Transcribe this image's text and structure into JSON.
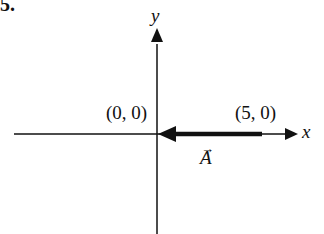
{
  "problem_number": "5.",
  "axes": {
    "x_label": "x",
    "y_label": "y"
  },
  "points": {
    "origin_label": "(0, 0)",
    "tip_label": "(5, 0)"
  },
  "vector": {
    "name": "A",
    "arrow_glyph": "→",
    "from": [
      5,
      0
    ],
    "to": [
      0,
      0
    ]
  },
  "colors": {
    "ink": "#111111",
    "background": "#ffffff"
  }
}
